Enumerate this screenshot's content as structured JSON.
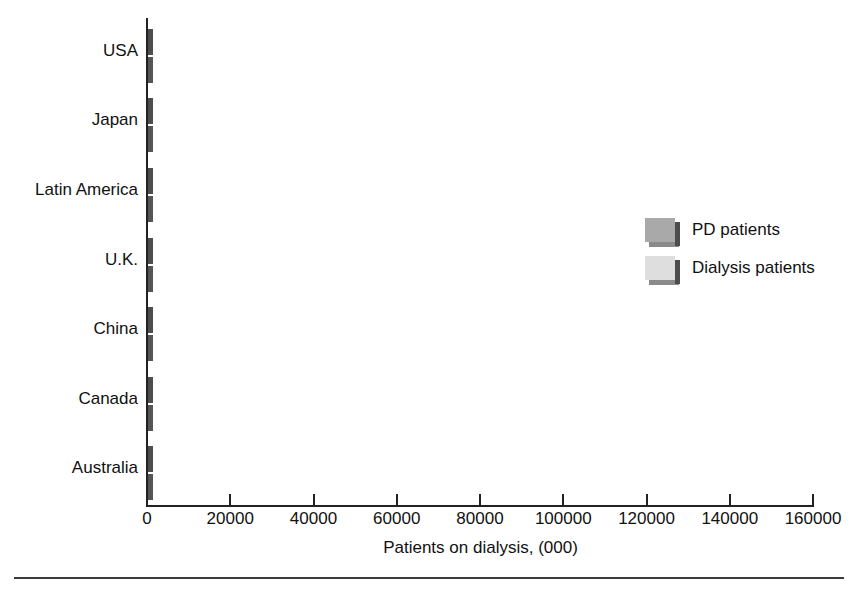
{
  "chart_data": {
    "type": "bar",
    "orientation": "horizontal",
    "title": "",
    "xlabel": "Patients on dialysis, (000)",
    "ylabel": "",
    "xlim": [
      0,
      160000
    ],
    "xticks": [
      0,
      20000,
      40000,
      60000,
      80000,
      100000,
      120000,
      140000,
      160000
    ],
    "xtick_labels": [
      "0",
      "20000",
      "40000",
      "60000",
      "80000",
      "100000",
      "120000",
      "140000",
      "160000"
    ],
    "grid": false,
    "legend_position": "right-middle",
    "categories": [
      "USA",
      "Japan",
      "Latin America",
      "U.K.",
      "China",
      "Canada",
      "Australia"
    ],
    "series": [
      {
        "name": "PD patients",
        "color": "#a9a9a9",
        "values": [
          26700,
          8000,
          15200,
          6300,
          3100,
          3300,
          1500
        ]
      },
      {
        "name": "Dialysis patients",
        "color": "#dedede",
        "values": [
          151000,
          125000,
          36000,
          12300,
          18800,
          8000,
          4000
        ]
      }
    ]
  },
  "legend": {
    "items": [
      {
        "label": "PD patients",
        "swatch": "pd"
      },
      {
        "label": "Dialysis patients",
        "swatch": "dialysis"
      }
    ]
  },
  "colors": {
    "pd_fill": "#a9a9a9",
    "dialysis_fill": "#dedede",
    "edge_dark": "#4d4d4d",
    "edge_shadow": "#8a8a8a",
    "axis": "#222222",
    "text": "#111111",
    "background": "#ffffff"
  }
}
